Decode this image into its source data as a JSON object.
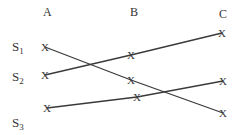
{
  "columns": [
    {
      "label": "A",
      "x": 47,
      "y": 6
    },
    {
      "label": "B",
      "x": 134,
      "y": 6
    },
    {
      "label": "C",
      "x": 223,
      "y": 8
    }
  ],
  "rows": [
    {
      "label": "S",
      "sub": "1",
      "x": 12,
      "y": 40
    },
    {
      "label": "S",
      "sub": "2",
      "x": 12,
      "y": 70
    },
    {
      "label": "S",
      "sub": "3",
      "x": 12,
      "y": 116
    }
  ],
  "marker": "X",
  "paths": [
    {
      "name": "path-s1",
      "points": [
        [
          45,
          47
        ],
        [
          131,
          80
        ],
        [
          223,
          113
        ]
      ]
    },
    {
      "name": "path-s2",
      "points": [
        [
          45,
          75
        ],
        [
          131,
          55
        ],
        [
          222,
          33
        ]
      ]
    },
    {
      "name": "path-s3",
      "points": [
        [
          47,
          108
        ],
        [
          137,
          97
        ],
        [
          223,
          81
        ]
      ]
    }
  ],
  "line_color": "#3a3a3a"
}
